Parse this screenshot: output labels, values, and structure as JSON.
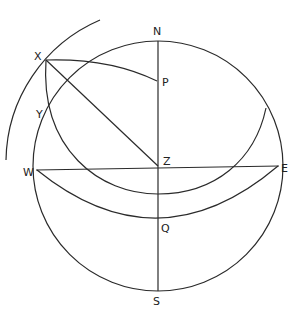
{
  "diagram": {
    "type": "celestial-sphere",
    "labels": {
      "N": "N",
      "S": "S",
      "E": "E",
      "W": "W",
      "Z": "Z",
      "P": "P",
      "Q": "Q",
      "X": "X",
      "Y": "Y"
    },
    "points": {
      "center": [
        158,
        166
      ],
      "N": [
        158,
        41
      ],
      "S": [
        158,
        291
      ],
      "W": [
        36,
        170
      ],
      "E": [
        279,
        166
      ],
      "Z": [
        158,
        166
      ],
      "P": [
        157,
        81
      ],
      "Q": [
        158,
        218
      ],
      "X": [
        46,
        60
      ],
      "Y": [
        49,
        111
      ]
    },
    "colors": {
      "ink": "#2a2a2a",
      "background": "#ffffff"
    }
  }
}
